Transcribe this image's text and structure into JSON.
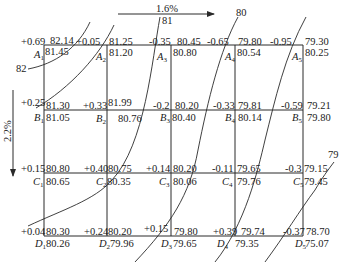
{
  "diagram": {
    "type": "site grading grid (cut/fill) with contour lines",
    "slopes": {
      "horizontal": "1.6%",
      "vertical": "2.2%"
    },
    "contours": [
      {
        "label": "82"
      },
      {
        "label": "81"
      },
      {
        "label": "80"
      },
      {
        "label": "79"
      }
    ],
    "rows": [
      "A",
      "B",
      "C",
      "D"
    ],
    "columns": [
      "1",
      "2",
      "3",
      "4",
      "5"
    ],
    "points": {
      "A1": {
        "name": "A",
        "sub": "1",
        "height_change": "+0.69",
        "design": "82.14",
        "natural": "81.45"
      },
      "A2": {
        "name": "A",
        "sub": "2",
        "height_change": "+0.05",
        "design": "81.25",
        "natural": "81.20"
      },
      "A3": {
        "name": "A",
        "sub": "3",
        "height_change": "-0.35",
        "design": "80.45",
        "natural": "80.80"
      },
      "A4": {
        "name": "A",
        "sub": "4",
        "height_change": "-0.65",
        "design": "79.80",
        "natural": "80.54"
      },
      "A5": {
        "name": "A",
        "sub": "5",
        "height_change": "-0.95",
        "design": "79.30",
        "natural": "80.25"
      },
      "B1": {
        "name": "B",
        "sub": "1",
        "height_change": "+0.25",
        "design": "81.30",
        "natural": "81.05"
      },
      "B2": {
        "name": "B",
        "sub": "2",
        "height_change": "+0.33",
        "design": "81.99",
        "natural": "80.76"
      },
      "B3": {
        "name": "B",
        "sub": "3",
        "height_change": "-0.2",
        "design": "80.20",
        "natural": "80.40"
      },
      "B4": {
        "name": "B",
        "sub": "4",
        "height_change": "-0.33",
        "design": "79.81",
        "natural": "80.14"
      },
      "B5": {
        "name": "B",
        "sub": "5",
        "height_change": "-0.59",
        "design": "79.21",
        "natural": "79.80"
      },
      "C1": {
        "name": "C",
        "sub": "1",
        "height_change": "+0.15",
        "design": "80.80",
        "natural": "80.65"
      },
      "C2": {
        "name": "C",
        "sub": "2",
        "height_change": "+0.40",
        "design": "80.75",
        "natural": "80.35"
      },
      "C3": {
        "name": "C",
        "sub": "3",
        "height_change": "+0.14",
        "design": "80.20",
        "natural": "80.06"
      },
      "C4": {
        "name": "C",
        "sub": "4",
        "height_change": "-0.11",
        "design": "79.65",
        "natural": "79.76"
      },
      "C5": {
        "name": "C",
        "sub": "5",
        "height_change": "-0.3",
        "design": "79.15",
        "natural": "79.45"
      },
      "D1": {
        "name": "D",
        "sub": "1",
        "height_change": "+0.04",
        "design": "80.30",
        "natural": "80.26"
      },
      "D2": {
        "name": "D",
        "sub": "2",
        "height_change": "+0.24",
        "design": "80.20",
        "natural": "79.96"
      },
      "D3": {
        "name": "D",
        "sub": "3",
        "height_change": "+0.15",
        "design": "79.80",
        "natural": "79.65"
      },
      "D4": {
        "name": "D",
        "sub": "4",
        "height_change": "+0.39",
        "design": "79.74",
        "natural": "79.35"
      },
      "D5": {
        "name": "D",
        "sub": "5",
        "height_change": "-0.37",
        "design": "78.70",
        "natural": "75.07"
      }
    },
    "colors": {
      "line": "#2a2a2a",
      "text": "#1a1a1a",
      "background": "#ffffff"
    }
  }
}
